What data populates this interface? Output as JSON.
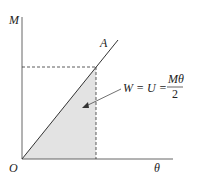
{
  "diagram": {
    "axes": {
      "y_label": "M",
      "x_label": "θ",
      "origin_label": "O"
    },
    "line_label": "A",
    "equation": {
      "lhs": "W = U =",
      "numerator": "Mθ",
      "denominator": "2"
    },
    "colors": {
      "shade": "#e3e3e3",
      "line": "#333333"
    }
  }
}
